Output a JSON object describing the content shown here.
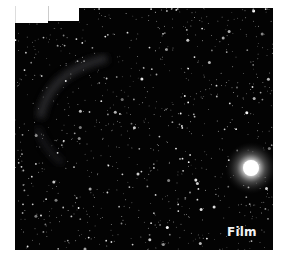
{
  "image": {
    "subject": "star field with faint nebula filament and bright star",
    "caption_label": "Film",
    "colors": {
      "sky": "#030303",
      "stars": "#ffffff",
      "label": "#f2f2f2"
    }
  }
}
